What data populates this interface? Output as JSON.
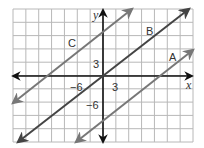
{
  "chart_data": {
    "type": "line",
    "title": "",
    "xlabel": "x",
    "ylabel": "y",
    "xlim": [
      -21,
      21
    ],
    "ylim": [
      -15,
      15
    ],
    "grid": true,
    "grid_step": 3,
    "x_tick_labels": [
      {
        "value": -6,
        "label": "−6"
      },
      {
        "value": 3,
        "label": "3"
      }
    ],
    "y_tick_labels": [
      {
        "value": 3,
        "label": "3"
      },
      {
        "value": -6,
        "label": "−6"
      }
    ],
    "series": [
      {
        "name": "A",
        "slope": 0.75,
        "intercept": -10,
        "color": "#777777"
      },
      {
        "name": "B",
        "slope": 0.75,
        "intercept": 0,
        "color": "#444444"
      },
      {
        "name": "C",
        "slope": 0.75,
        "intercept": 10,
        "color": "#777777"
      }
    ]
  },
  "labels": {
    "x_axis": "x",
    "y_axis": "y",
    "line_a": "A",
    "line_b": "B",
    "line_c": "C",
    "x_tick_neg6": "−6",
    "x_tick_3": "3",
    "y_tick_3": "3",
    "y_tick_neg6": "−6"
  },
  "colors": {
    "grid": "#b8b8b8",
    "axis": "#111111",
    "line_a": "#777777",
    "line_b": "#444444",
    "line_c": "#777777"
  }
}
